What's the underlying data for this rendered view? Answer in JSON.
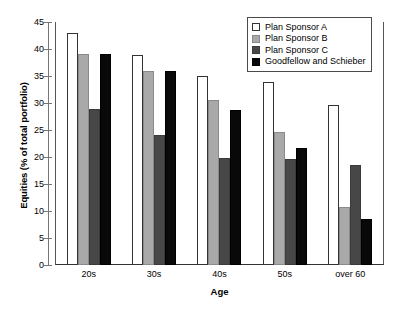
{
  "chart_data": {
    "type": "bar",
    "title": "",
    "xlabel": "Age",
    "ylabel": "Equities (% of total portfolio)",
    "categories": [
      "20s",
      "30s",
      "40s",
      "50s",
      "over 60"
    ],
    "series": [
      {
        "name": "Plan Sponsor A",
        "color": "#ffffff",
        "values": [
          43.0,
          38.9,
          35.0,
          33.9,
          29.6
        ]
      },
      {
        "name": "Plan Sponsor B",
        "color": "#a9a9a9",
        "values": [
          39.1,
          36.0,
          30.6,
          24.7,
          10.7
        ]
      },
      {
        "name": "Plan Sponsor C",
        "color": "#474747",
        "values": [
          28.9,
          24.0,
          19.8,
          19.7,
          18.6
        ]
      },
      {
        "name": "Goodfellow and Schieber",
        "color": "#090909",
        "values": [
          39.1,
          35.9,
          28.7,
          21.6,
          8.6
        ]
      }
    ],
    "ylim": [
      0,
      45
    ],
    "yticks": [
      0,
      5,
      10,
      15,
      20,
      25,
      30,
      35,
      40,
      45
    ],
    "ytick_labels": [
      "0",
      "5",
      "10",
      "15",
      "20",
      "25",
      "30",
      "35",
      "40",
      "45"
    ],
    "grid": false,
    "legend_position": "top-right"
  }
}
